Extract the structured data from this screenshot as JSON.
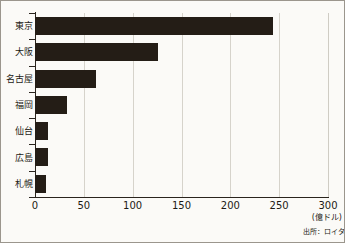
{
  "chart_data": {
    "type": "bar",
    "orientation": "horizontal",
    "title": "",
    "xlabel": "",
    "ylabel": "",
    "unit_label": "(億ドル)",
    "source_label": "出所：ロイタ",
    "categories": [
      "東京",
      "大阪",
      "名古屋",
      "福岡",
      "仙台",
      "広島",
      "札幌"
    ],
    "values": [
      244,
      126,
      62,
      33,
      13,
      13,
      11
    ],
    "xlim": [
      0,
      300
    ],
    "xticks": [
      0,
      50,
      100,
      150,
      200,
      250,
      300
    ],
    "xticklabels": [
      "0",
      "50",
      "100",
      "150",
      "200",
      "250",
      "300"
    ],
    "grid": "vertical",
    "legend": "none",
    "bar_color": "#241d16",
    "background_color": "#fbfaf7",
    "axis_color": "#2a241d",
    "gridline_color": "#d6d3cb"
  }
}
